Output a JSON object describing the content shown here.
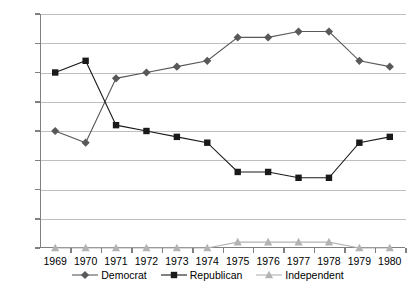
{
  "chart_data": {
    "type": "line",
    "title": "",
    "xlabel": "",
    "ylabel": "",
    "categories": [
      "1969",
      "1970",
      "1971",
      "1972",
      "1973",
      "1974",
      "1975",
      "1976",
      "1977",
      "1978",
      "1979",
      "1980"
    ],
    "ylim": [
      0,
      40
    ],
    "yticks": [
      0,
      5,
      10,
      15,
      20,
      25,
      30,
      35,
      40
    ],
    "ytick_labels": [
      "0",
      "5",
      "10",
      "15",
      "20",
      "25",
      "30",
      "35",
      "40"
    ],
    "grid": true,
    "legend_position": "bottom",
    "series": [
      {
        "name": "Democrat",
        "marker": "diamond",
        "color": "#595959",
        "values": [
          20,
          18,
          29,
          30,
          31,
          32,
          36,
          36,
          37,
          37,
          32,
          31
        ]
      },
      {
        "name": "Republican",
        "marker": "square",
        "color": "#1a1a1a",
        "values": [
          30,
          32,
          21,
          20,
          19,
          18,
          13,
          13,
          12,
          12,
          18,
          19
        ]
      },
      {
        "name": "Independent",
        "marker": "triangle",
        "color": "#b3b3b3",
        "values": [
          0,
          0,
          0,
          0,
          0,
          0,
          1,
          1,
          1,
          1,
          0,
          0
        ]
      }
    ]
  },
  "axis": {
    "line_color": "#808080",
    "grid_color": "#bfbfbf"
  }
}
